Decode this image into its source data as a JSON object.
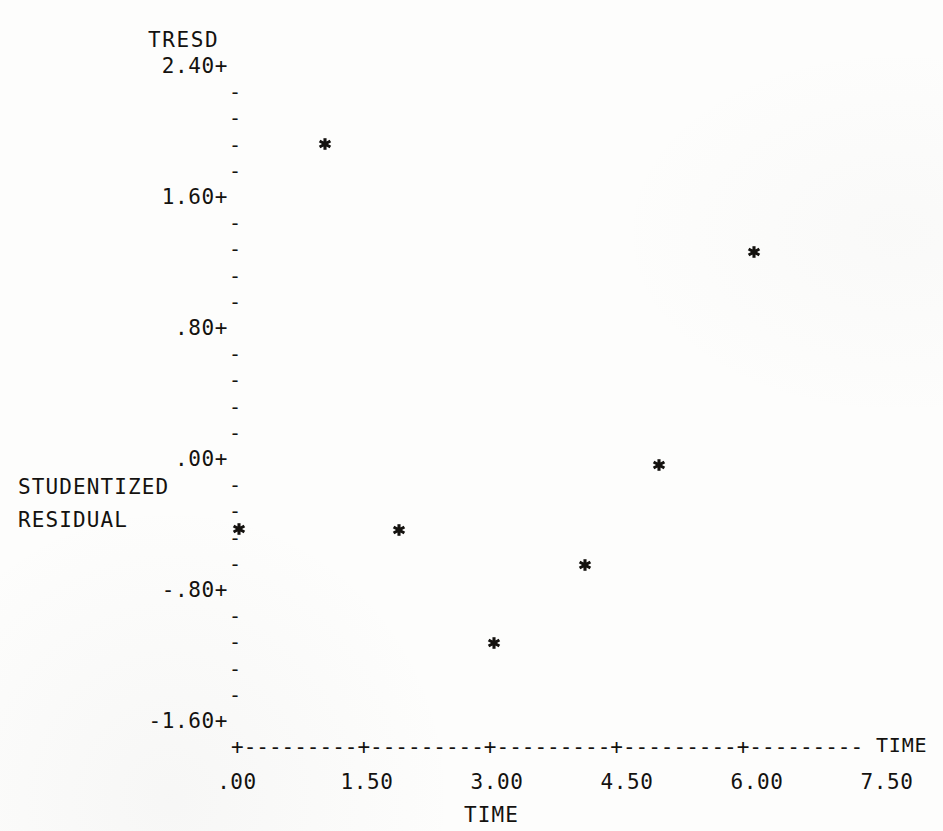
{
  "chart_data": {
    "type": "scatter",
    "title": "TRESD",
    "xlabel": "TIME",
    "ylabel": "STUDENTIZED RESIDUAL",
    "ylabel_lines": [
      "STUDENTIZED",
      "RESIDUAL"
    ],
    "axis_end_label": "TIME",
    "grid": false,
    "legend": null,
    "xlim": [
      -0.27,
      8.4
    ],
    "ylim": [
      -1.6,
      2.4
    ],
    "xticks": [
      0,
      1.5,
      3,
      4.5,
      6,
      7.5
    ],
    "xtick_labels": [
      ".00",
      "1.50",
      "3.00",
      "4.50",
      "6.00",
      "7.50"
    ],
    "yticks": [
      2.4,
      1.6,
      0.8,
      0,
      -0.8,
      -1.6
    ],
    "ytick_labels": [
      "2.40+",
      "1.60+",
      ".80+",
      ".00+",
      "-.80+",
      "-1.60+"
    ],
    "y_minor_per_major": 4,
    "minor_tick_glyph": "-",
    "major_tick_glyph": "+",
    "marker_glyph": "*",
    "points": [
      {
        "x": 0.02,
        "y": -0.42
      },
      {
        "x": 1.01,
        "y": 1.93
      },
      {
        "x": 1.87,
        "y": -0.43
      },
      {
        "x": 2.97,
        "y": -1.12
      },
      {
        "x": 4.02,
        "y": -0.64
      },
      {
        "x": 4.87,
        "y": -0.03
      },
      {
        "x": 5.97,
        "y": 1.27
      }
    ]
  },
  "render": {
    "ink_color": "#14120f",
    "paper_color": "#fdfdfc",
    "x_axis_line": "+---------+---------+---------+---------+---------"
  }
}
